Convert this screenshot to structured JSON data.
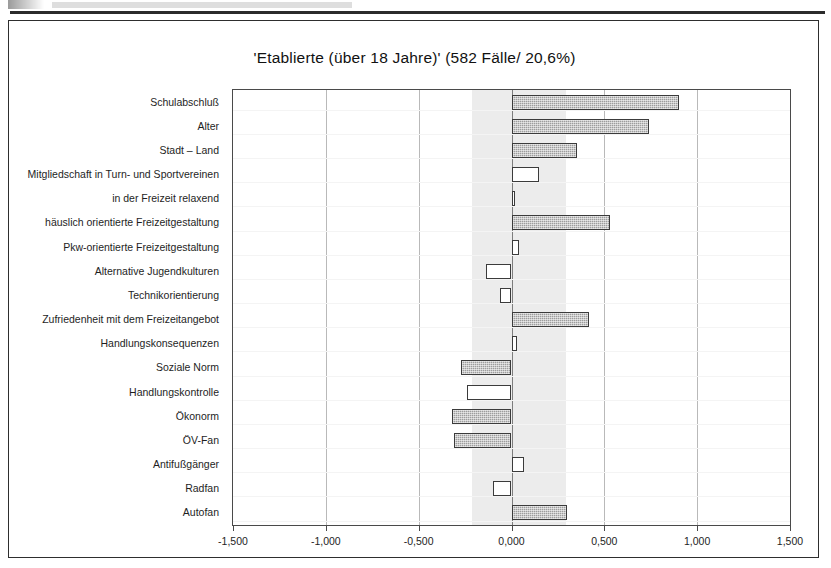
{
  "chart_data": {
    "type": "bar",
    "orientation": "horizontal",
    "title": "'Etablierte (über 18 Jahre)' (582 Fälle/ 20,6%)",
    "xlabel": "",
    "ylabel": "",
    "xlim": [
      -1.5,
      1.5
    ],
    "xticks": [
      -1.5,
      -1.0,
      -0.5,
      0.0,
      0.5,
      1.0,
      1.5
    ],
    "xticklabels": [
      "-1,500",
      "-1,000",
      "-0,500",
      "0,000",
      "0,500",
      "1,000",
      "1,500"
    ],
    "grid": true,
    "legend": null,
    "significance_band": [
      -0.215,
      0.295
    ],
    "categories": [
      "Schulabschluß",
      "Alter",
      "Stadt – Land",
      "Mitgliedschaft in Turn- und Sportvereinen",
      "in der Freizeit relaxend",
      "häuslich orientierte Freizeitgestaltung",
      "Pkw-orientierte Freizeitgestaltung",
      "Alternative Jugendkulturen",
      "Technikorientierung",
      "Zufriedenheit mit dem Freizeitangebot",
      "Handlungskonsequenzen",
      "Soziale Norm",
      "Handlungskontrolle",
      "Ökonorm",
      "ÖV-Fan",
      "Antifußgänger",
      "Radfan",
      "Autofan"
    ],
    "values": [
      0.9,
      0.74,
      0.355,
      0.15,
      0.02,
      0.53,
      0.04,
      -0.135,
      -0.06,
      0.42,
      0.03,
      -0.27,
      -0.24,
      -0.32,
      -0.31,
      0.07,
      -0.1,
      0.3
    ],
    "fill": [
      "filled",
      "filled",
      "filled",
      "hollow",
      "hollow",
      "filled",
      "hollow",
      "hollow",
      "hollow",
      "filled",
      "hollow",
      "filled",
      "hollow",
      "filled",
      "filled",
      "hollow",
      "hollow",
      "filled"
    ]
  },
  "colors": {
    "bar_fill": "#9d9d9d",
    "bar_border": "#3b3b3b",
    "bar_hollow": "#ffffff",
    "band": "#ececec",
    "gridline": "#b9b9b9",
    "frame": "#4a4a4a",
    "text": "#1e1e1e"
  }
}
